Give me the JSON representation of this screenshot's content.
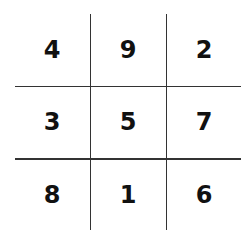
{
  "grid": {
    "rows": [
      [
        "4",
        "9",
        "2"
      ],
      [
        "3",
        "5",
        "7"
      ],
      [
        "8",
        "1",
        "6"
      ]
    ]
  },
  "colors": {
    "line": "#333333",
    "text": "#111111",
    "background": "#ffffff"
  }
}
